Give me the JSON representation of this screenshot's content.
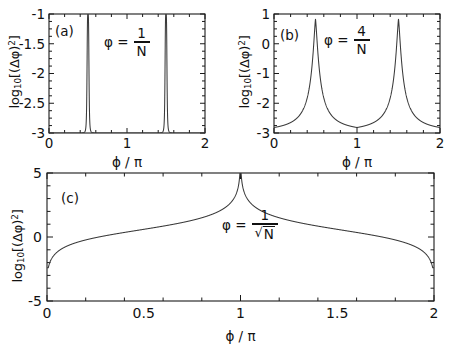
{
  "figure": {
    "background": "#ffffff",
    "curve_color": "#3a3a3a",
    "axis_color": "#1a1a1a"
  },
  "chart_data": [
    {
      "type": "line",
      "panel_label": "(a)",
      "title": "",
      "annotation": {
        "variable": "φ",
        "equals": "=",
        "numerator": "1",
        "denominator": "N"
      },
      "xlabel": "ϕ / π",
      "ylabel": "log10[(Δ ϕ)2]",
      "ylabel_parts": {
        "log": "log",
        "base": "10",
        "open": "[(Δ ϕ)",
        "exp": "2",
        "close": "]"
      },
      "xlim": [
        0,
        2
      ],
      "ylim": [
        -3,
        -1
      ],
      "xticks": [
        0,
        1,
        2
      ],
      "xticklabels": [
        "0",
        "1",
        "2"
      ],
      "yticks": [
        -1,
        -1.5,
        -2,
        -2.5,
        -3
      ],
      "yticklabels": [
        "-1",
        "-1.5",
        "-2",
        "-2.5",
        "-3"
      ],
      "minor_x_count": 10,
      "minor_y_count": 4,
      "grid": false,
      "legend": "none",
      "peaks": [
        0.5,
        1.5
      ],
      "peak_width": 0.013,
      "baseline": -3.0,
      "peak_top": -1.0,
      "description": "Two extremely narrow Lorentzian spikes rising from the -3 floor to the top of the frame at phi/pi = 0.5 and 1.5"
    },
    {
      "type": "line",
      "panel_label": "(b)",
      "title": "",
      "annotation": {
        "variable": "φ",
        "equals": "=",
        "numerator": "4",
        "denominator": "N"
      },
      "xlabel": "ϕ / π",
      "ylabel": "log10[(Δ ϕ)2]",
      "ylabel_parts": {
        "log": "log",
        "base": "10",
        "open": "[(Δ ϕ)",
        "exp": "2",
        "close": "]"
      },
      "xlim": [
        0,
        2
      ],
      "ylim": [
        -3,
        1
      ],
      "xticks": [
        0,
        1,
        2
      ],
      "xticklabels": [
        "0",
        "1",
        "2"
      ],
      "yticks": [
        1,
        0,
        -1,
        -2,
        -3
      ],
      "yticklabels": [
        "1",
        "0",
        "-1",
        "-2",
        "-3"
      ],
      "minor_x_count": 10,
      "minor_y_count": 4,
      "grid": false,
      "legend": "none",
      "peaks": [
        0.5,
        1.5
      ],
      "peak_width": 0.055,
      "baseline": -3.0,
      "peak_top": 0.82,
      "description": "Two sharp cusped peaks reaching about 0.8 at phi/pi = 0.5 and 1.5, with broad tails decaying to the -3 floor"
    },
    {
      "type": "line",
      "panel_label": "(c)",
      "title": "",
      "annotation": {
        "variable": "φ",
        "equals": "=",
        "numerator": "1",
        "denominator_sqrt": "N"
      },
      "xlabel": "ϕ / π",
      "ylabel": "log10[(Δ ϕ)2]",
      "ylabel_parts": {
        "log": "log",
        "base": "10",
        "open": "[(Δ ϕ)",
        "exp": "2",
        "close": "]"
      },
      "xlim": [
        0,
        2
      ],
      "ylim": [
        -5,
        5
      ],
      "xticks": [
        0,
        0.5,
        1,
        1.5,
        2
      ],
      "xticklabels": [
        "0",
        "0.5",
        "1",
        "1.5",
        "2"
      ],
      "yticks": [
        5,
        0,
        -5
      ],
      "yticklabels": [
        "5",
        "0",
        "-5"
      ],
      "minor_x_count": 10,
      "minor_y_count": 5,
      "grid": false,
      "legend": "none",
      "peaks": [
        0.5,
        1.5
      ],
      "peak_width": 0.02,
      "peak_top": 5.0,
      "edge_value": -2.4,
      "center_dip": -2.3,
      "description": "Broad smooth curve starting near -2.4 at phi/pi = 0, rising to a sharp spike of 5 at 0.5, descending to a V-shaped dip of -2.3 at 1.0, rising to a second spike of 5 at 1.5, then falling to -2.4 at 2.0"
    }
  ]
}
